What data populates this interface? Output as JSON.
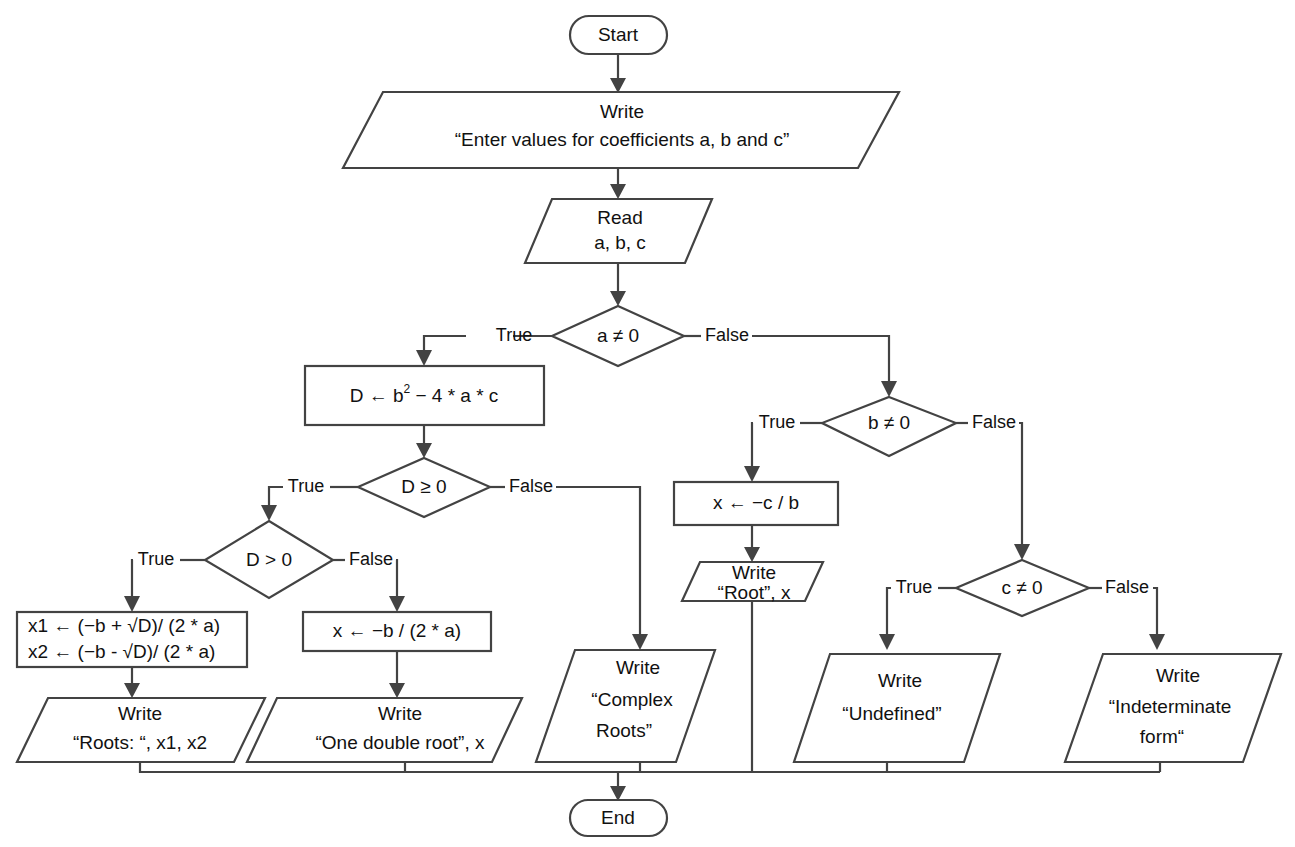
{
  "diagram": {
    "type": "flowchart",
    "stroke_color": "#434343",
    "text_color": "#111111",
    "background_color": "#ffffff"
  },
  "nodes": {
    "start": {
      "label": "Start",
      "shape": "terminator"
    },
    "end": {
      "label": "End",
      "shape": "terminator"
    },
    "write_prompt": {
      "shape": "io",
      "line1": "Write",
      "line2": "“Enter values  for coefficients a, b and c”"
    },
    "read_abc": {
      "shape": "io",
      "line1": "Read",
      "line2": "a, b, c"
    },
    "dec_a": {
      "shape": "decision",
      "label": "a ≠ 0"
    },
    "dec_b": {
      "shape": "decision",
      "label": "b ≠ 0"
    },
    "dec_c": {
      "shape": "decision",
      "label": "c ≠ 0"
    },
    "dec_d_ge": {
      "shape": "decision",
      "label": "D ≥ 0"
    },
    "dec_d_gt": {
      "shape": "decision",
      "label": "D > 0"
    },
    "calc_d": {
      "shape": "process",
      "prefix": "D ←  b",
      "superscript": "2",
      "suffix": " − 4 * a * c"
    },
    "calc_roots": {
      "shape": "process",
      "line1": "x1 ← (−b + √D)/ (2 * a)",
      "line2": "x2 ← (−b - √D)/ (2 * a)"
    },
    "calc_double_root": {
      "shape": "process",
      "label": "x ← −b / (2 * a)"
    },
    "calc_linear": {
      "shape": "process",
      "label": "x ← −c / b"
    },
    "write_roots": {
      "shape": "io",
      "line1": "Write",
      "line2": "“Roots: “, x1, x2"
    },
    "write_double_root": {
      "shape": "io",
      "line1": "Write",
      "line2": "“One double root”, x"
    },
    "write_complex": {
      "shape": "io",
      "line1": "Write",
      "line2": "“Complex",
      "line3": "Roots”"
    },
    "write_root": {
      "shape": "io",
      "line1": "Write",
      "line2": "“Root”, x"
    },
    "write_undefined": {
      "shape": "io",
      "line1": "Write",
      "line2": "“Undefined”"
    },
    "write_indeterminate": {
      "shape": "io",
      "line1": "Write",
      "line2": "“Indeterminate",
      "line3": "form“"
    }
  },
  "edge_labels": {
    "a_true": "True",
    "a_false": "False",
    "b_true": "True",
    "b_false": "False",
    "c_true": "True",
    "c_false": "False",
    "dge_true": "True",
    "dge_false": "False",
    "dgt_true": "True",
    "dgt_false": "False"
  }
}
